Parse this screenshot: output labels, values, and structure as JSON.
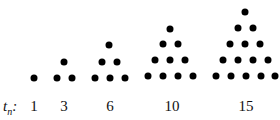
{
  "diagram": {
    "row_label": {
      "base": "t",
      "subscript": "n",
      "suffix": ":"
    },
    "dot_color": "#000000",
    "figures": [
      {
        "value": "1",
        "label_x": 34,
        "dots": [
          [
            34,
            78
          ]
        ]
      },
      {
        "value": "3",
        "label_x": 64,
        "dots": [
          [
            57,
            78
          ],
          [
            72,
            78
          ],
          [
            64,
            62
          ]
        ]
      },
      {
        "value": "6",
        "label_x": 110,
        "dots": [
          [
            95,
            78
          ],
          [
            110,
            78
          ],
          [
            125,
            78
          ],
          [
            102,
            62
          ],
          [
            117,
            62
          ],
          [
            109,
            45
          ]
        ]
      },
      {
        "value": "10",
        "label_x": 172,
        "dots": [
          [
            148,
            76
          ],
          [
            163,
            76
          ],
          [
            178,
            76
          ],
          [
            193,
            76
          ],
          [
            155,
            60
          ],
          [
            170,
            60
          ],
          [
            185,
            60
          ],
          [
            163,
            44
          ],
          [
            178,
            44
          ],
          [
            170,
            29
          ]
        ]
      },
      {
        "value": "15",
        "label_x": 246,
        "dots": [
          [
            216,
            76
          ],
          [
            231,
            76
          ],
          [
            246,
            76
          ],
          [
            261,
            76
          ],
          [
            275,
            76
          ],
          [
            223,
            60
          ],
          [
            238,
            60
          ],
          [
            253,
            60
          ],
          [
            268,
            60
          ],
          [
            230,
            44
          ],
          [
            245,
            44
          ],
          [
            260,
            44
          ],
          [
            238,
            28
          ],
          [
            253,
            28
          ],
          [
            245,
            12
          ]
        ]
      }
    ]
  }
}
